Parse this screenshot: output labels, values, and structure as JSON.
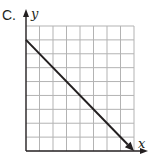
{
  "figure": {
    "label": "C.",
    "x_axis_label": "x",
    "y_axis_label": "y"
  },
  "chart_data": {
    "type": "line",
    "grid": {
      "columns": 8,
      "rows": 9,
      "on": true
    },
    "xlim": [
      0,
      8
    ],
    "ylim": [
      0,
      9
    ],
    "series": [
      {
        "name": "line",
        "points": [
          [
            0,
            8
          ],
          [
            8,
            0
          ]
        ],
        "arrow_end": true
      }
    ],
    "xlabel": "x",
    "ylabel": "y",
    "tick_labels": false
  },
  "colors": {
    "grid": "#b3b3b3",
    "axis": "#231f20",
    "line": "#231f20"
  }
}
